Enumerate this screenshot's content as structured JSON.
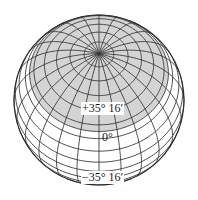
{
  "figure": {
    "type": "globe-orthographic",
    "center": [
      99,
      100
    ],
    "radius": 85,
    "view_latitude_deg": 57,
    "meridian_step_deg": 15,
    "parallel_step_deg": 10,
    "cap_boundary_latitude_deg": 35.267,
    "colors": {
      "background": "#ffffff",
      "cap_fill": "#d4d4d4",
      "grid_line": "#3a3a3a",
      "outline": "#2a2a2a"
    }
  },
  "labels": {
    "upper_latitude": "+35° 16′",
    "equator": "0°",
    "lower_latitude": "−35° 16′"
  }
}
